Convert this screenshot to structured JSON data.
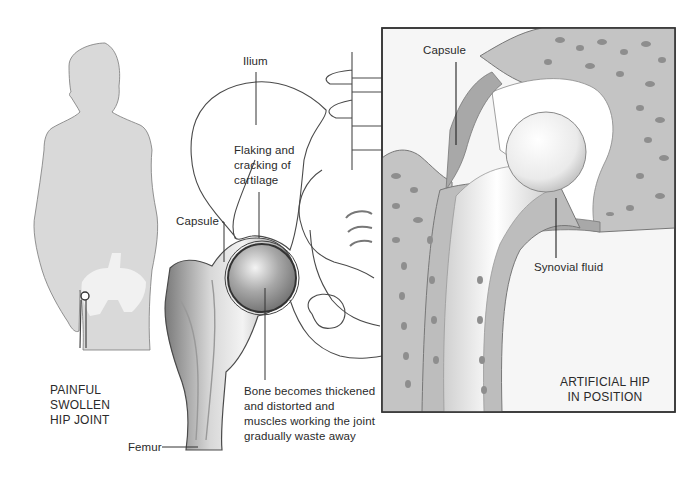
{
  "figure": {
    "colors": {
      "background": "#ffffff",
      "silhouette": "#d9d9d9",
      "bone_shading": "#9a9a9a",
      "inset_bone": "#bdbdbd",
      "inset_capsule": "#a8a8a8",
      "prosthesis": "#f2f2f2",
      "line": "#333333"
    }
  },
  "left_panel": {
    "title_lines": [
      "PAINFUL",
      "SWOLLEN",
      "HIP JOINT"
    ]
  },
  "middle_panel": {
    "labels": {
      "ilium": "Ilium",
      "flaking_lines": [
        "Flaking and",
        "cracking of",
        "cartilage"
      ],
      "capsule": "Capsule",
      "bone_lines": [
        "Bone becomes thickened",
        "and distorted and",
        "muscles working the joint",
        "gradually waste away"
      ],
      "femur": "Femur"
    }
  },
  "inset_panel": {
    "labels": {
      "capsule": "Capsule",
      "synovial_fluid": "Synovial fluid"
    },
    "title_lines": [
      "ARTIFICIAL HIP",
      "IN POSITION"
    ]
  }
}
